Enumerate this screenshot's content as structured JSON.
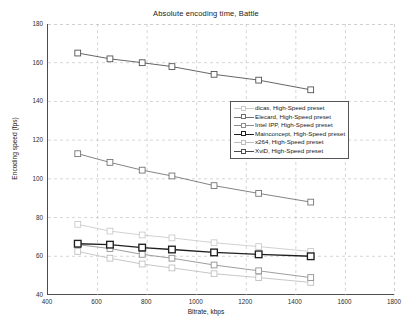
{
  "chart_data": {
    "type": "line",
    "title": "Absolute encoding time, Battle",
    "xlabel": "Bitrate, kbps",
    "ylabel": "Encoding speed (fps)",
    "xlim": [
      400,
      1800
    ],
    "ylim": [
      40,
      180
    ],
    "xticks": [
      400,
      600,
      800,
      1000,
      1200,
      1400,
      1600,
      1800
    ],
    "yticks": [
      40,
      60,
      80,
      100,
      120,
      140,
      160,
      180
    ],
    "grid": "dashed",
    "legend_position": "center",
    "series": [
      {
        "name": "dicas, High-Speed preset",
        "color": "#c9c9c9",
        "marker": "square",
        "x": [
          520,
          650,
          780,
          900,
          1070,
          1250,
          1460
        ],
        "y": [
          76.5,
          73.0,
          71.0,
          69.5,
          67.0,
          65.0,
          62.5
        ]
      },
      {
        "name": "Elecard, High-Speed preset",
        "color": "#6e6e6e",
        "marker": "square",
        "x": [
          520,
          650,
          780,
          900,
          1070,
          1250,
          1460
        ],
        "y": [
          113.0,
          108.5,
          104.5,
          101.5,
          96.5,
          92.5,
          88.0
        ]
      },
      {
        "name": "Intel IPP, High-Speed preset",
        "color": "#8c8c8c",
        "marker": "square",
        "x": [
          520,
          650,
          780,
          900,
          1070,
          1250,
          1460
        ],
        "y": [
          66.0,
          64.0,
          61.0,
          59.0,
          55.5,
          52.5,
          49.0
        ]
      },
      {
        "name": "Mainconcept, High-Speed preset",
        "color": "#1f1f1f",
        "marker": "square",
        "x": [
          520,
          650,
          780,
          900,
          1070,
          1250,
          1460
        ],
        "y": [
          66.5,
          66.0,
          64.5,
          63.5,
          62.0,
          61.0,
          60.0
        ]
      },
      {
        "name": "x264, High-Speed preset",
        "color": "#bdbdbd",
        "marker": "square",
        "x": [
          520,
          650,
          780,
          900,
          1070,
          1250,
          1460
        ],
        "y": [
          62.5,
          59.0,
          56.0,
          54.0,
          51.0,
          49.0,
          46.5
        ]
      },
      {
        "name": "XviD, High-Speed preset",
        "color": "#4a4a4a",
        "marker": "square",
        "x": [
          520,
          650,
          780,
          900,
          1070,
          1250,
          1460
        ],
        "y": [
          165.0,
          162.0,
          160.0,
          158.0,
          154.0,
          151.0,
          146.0
        ]
      }
    ]
  },
  "legend": {
    "items": [
      {
        "label": "dicas, High-Speed preset"
      },
      {
        "label": "Elecard, High-Speed preset"
      },
      {
        "label": "Intel IPP, High-Speed preset"
      },
      {
        "label": "Mainconcept, High-Speed preset"
      },
      {
        "label": "x264, High-Speed preset"
      },
      {
        "label": "XviD, High-Speed preset"
      }
    ]
  }
}
